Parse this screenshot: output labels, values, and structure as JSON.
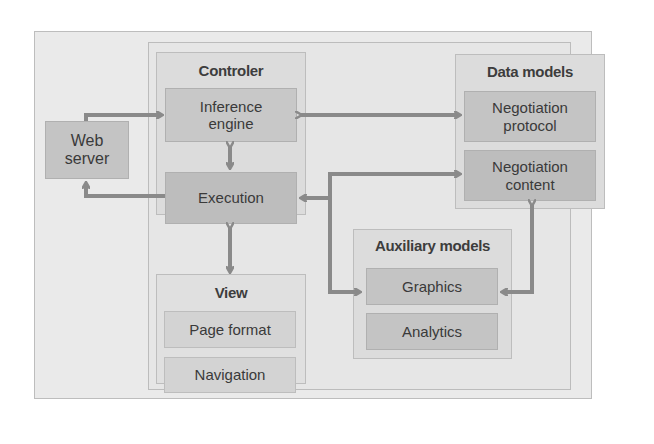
{
  "diagram": {
    "web_server": {
      "label_line1": "Web",
      "label_line2": "server"
    },
    "controler": {
      "title": "Controler",
      "inference_engine": {
        "line1": "Inference",
        "line2": "engine"
      },
      "execution": {
        "label": "Execution"
      }
    },
    "view": {
      "title": "View",
      "items": [
        "Page format",
        "Navigation"
      ]
    },
    "data_models": {
      "title": "Data models",
      "negotiation_protocol": {
        "line1": "Negotiation",
        "line2": "protocol"
      },
      "negotiation_content": {
        "line1": "Negotiation",
        "line2": "content"
      }
    },
    "auxiliary_models": {
      "title": "Auxiliary models",
      "items": [
        "Graphics",
        "Analytics"
      ]
    },
    "colors": {
      "background_outer": "#e9e9e9",
      "group_fill": "#dcdcdc",
      "box_dark": "#c4c4c4",
      "arrow": "#8a8a8a",
      "text": "#3a3a3a"
    }
  }
}
